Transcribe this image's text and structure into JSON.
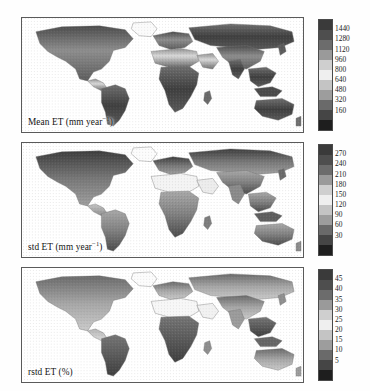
{
  "figure": {
    "background_color": "#fefefe",
    "frame_color": "#5a5a5a",
    "projection": "equirectangular",
    "panel_count": 3
  },
  "chart_data": {
    "type": "heatmap",
    "xlabel": "",
    "ylabel": "",
    "grid": false,
    "legend_position": "right",
    "panels": [
      {
        "id": "mean-et",
        "label_text": "Mean ET (mm year",
        "label_sup": "−1",
        "label_tail": ")",
        "label_plain": "Mean ET (mm year−1)",
        "variable": "Mean ET",
        "units": "mm year-1",
        "colorbar": {
          "orientation": "vertical",
          "ticks": [
            1440,
            1280,
            1120,
            960,
            800,
            640,
            480,
            320,
            160
          ],
          "tick_labels": [
            "1440",
            "1280",
            "1120",
            "960",
            "800",
            "640",
            "480",
            "320",
            "160"
          ],
          "vmin": 0,
          "vmax": 1600,
          "step": 160,
          "colors": [
            "#3a3a3a",
            "#4e4e4e",
            "#6c6c6c",
            "#9a9a9a",
            "#cfcfcf",
            "#efefef",
            "#c4c4c4",
            "#9d9d9d",
            "#6a6a6a",
            "#454545",
            "#1e1e1e"
          ]
        }
      },
      {
        "id": "std-et",
        "label_text": "std ET (mm year",
        "label_sup": "−1",
        "label_tail": ")",
        "label_plain": "std ET (mm year−1)",
        "variable": "std ET",
        "units": "mm year-1",
        "colorbar": {
          "orientation": "vertical",
          "ticks": [
            270,
            240,
            210,
            180,
            150,
            120,
            90,
            60,
            30
          ],
          "tick_labels": [
            "270",
            "240",
            "210",
            "180",
            "150",
            "120",
            "90",
            "60",
            "30"
          ],
          "vmin": 0,
          "vmax": 300,
          "step": 30,
          "colors": [
            "#3a3a3a",
            "#4e4e4e",
            "#6c6c6c",
            "#9a9a9a",
            "#cfcfcf",
            "#efefef",
            "#c4c4c4",
            "#9d9d9d",
            "#6a6a6a",
            "#454545",
            "#1e1e1e"
          ]
        }
      },
      {
        "id": "rstd-et",
        "label_text": "rstd ET (%)",
        "label_sup": "",
        "label_tail": "",
        "label_plain": "rstd ET (%)",
        "variable": "rstd ET",
        "units": "%",
        "colorbar": {
          "orientation": "vertical",
          "ticks": [
            45,
            40,
            35,
            30,
            25,
            20,
            15,
            10,
            5
          ],
          "tick_labels": [
            "45",
            "40",
            "35",
            "30",
            "25",
            "20",
            "15",
            "10",
            "5"
          ],
          "vmin": 0,
          "vmax": 50,
          "step": 5,
          "colors": [
            "#3a3a3a",
            "#4e4e4e",
            "#6c6c6c",
            "#9a9a9a",
            "#cfcfcf",
            "#efefef",
            "#c4c4c4",
            "#9d9d9d",
            "#6a6a6a",
            "#454545",
            "#1e1e1e"
          ]
        }
      }
    ]
  }
}
